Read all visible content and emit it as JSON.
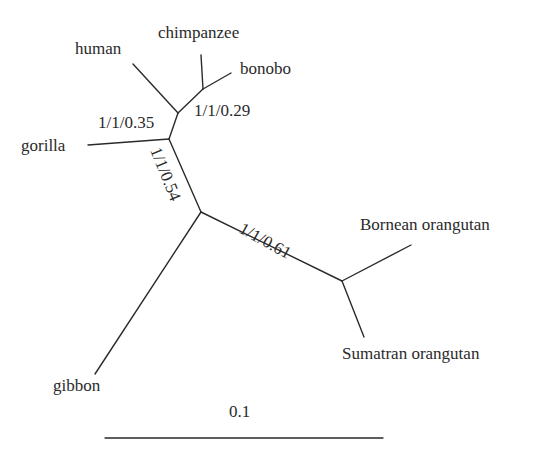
{
  "diagram": {
    "type": "unrooted phylogenetic tree",
    "leaves": [
      {
        "id": "human",
        "label": "human"
      },
      {
        "id": "chimpanzee",
        "label": "chimpanzee"
      },
      {
        "id": "bonobo",
        "label": "bonobo"
      },
      {
        "id": "gorilla",
        "label": "gorilla"
      },
      {
        "id": "bornean",
        "label": "Bornean orangutan"
      },
      {
        "id": "sumatran",
        "label": "Sumatran orangutan"
      },
      {
        "id": "gibbon",
        "label": "gibbon"
      }
    ],
    "support_values": [
      {
        "clade": "chimpanzee+bonobo",
        "label": "1/1/0.29"
      },
      {
        "clade": "human+chimpanzee+bonobo",
        "label": "1/1/0.35"
      },
      {
        "clade": "human+chimpanzee+bonobo+gorilla",
        "label": "1/1/0.54"
      },
      {
        "clade": "orangutans",
        "label": "1/1/0.61"
      }
    ],
    "scale_bar": {
      "label": "0.1"
    },
    "colors": {
      "line": "#2a2a2a",
      "text": "#2a2a2a",
      "background": "#ffffff"
    }
  }
}
